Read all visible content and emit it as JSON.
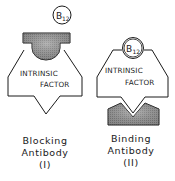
{
  "diagram": {
    "type": "schematic",
    "panels": [
      {
        "id": "blocking",
        "ligand": {
          "label": "B",
          "subscript": "12"
        },
        "protein": {
          "line1": "INTRINSIC",
          "line2": "FACTOR"
        },
        "antibody_caption": {
          "line1": "Blocking",
          "line2": "Antibody",
          "numeral": "(I)"
        }
      },
      {
        "id": "binding",
        "ligand": {
          "label": "B",
          "subscript": "12"
        },
        "protein": {
          "line1": "INTRINSIC",
          "line2": "FACTOR"
        },
        "antibody_caption": {
          "line1": "Binding",
          "line2": "Antibody",
          "numeral": "(II)"
        }
      }
    ],
    "colors": {
      "outline": "#1a1a1a",
      "antibody_fill": "#8a8a8a",
      "background": "#ffffff"
    }
  }
}
